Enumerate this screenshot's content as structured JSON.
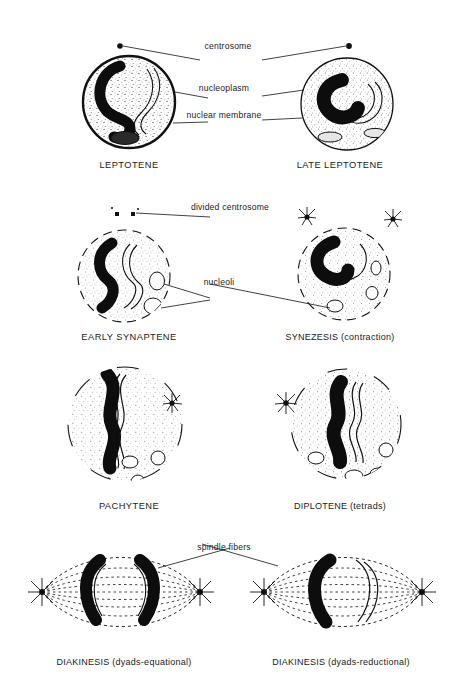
{
  "figure": {
    "background_color": "#ffffff",
    "ink_color": "#111111"
  },
  "annotations": [
    {
      "id": "centrosome",
      "label": "centrosome",
      "x": 228,
      "y": 46
    },
    {
      "id": "nucleoplasm",
      "label": "nucleoplasm",
      "x": 224,
      "y": 88
    },
    {
      "id": "nuclear-membrane",
      "label": "nuclear membrane",
      "x": 224,
      "y": 115
    },
    {
      "id": "divided-centrosome",
      "label": "divided centrosome",
      "x": 230,
      "y": 207
    },
    {
      "id": "nucleoli",
      "label": "nucleoli",
      "x": 219,
      "y": 282
    },
    {
      "id": "spindle-fibers",
      "label": "spindle fibers",
      "x": 224,
      "y": 547
    }
  ],
  "stages": [
    {
      "id": "leptotene",
      "caption": "LEPTOTENE",
      "caption_x": 129,
      "caption_y": 160,
      "row": 1,
      "col": 1
    },
    {
      "id": "late-leptotene",
      "caption": "LATE LEPTOTENE",
      "caption_x": 340,
      "caption_y": 160,
      "row": 1,
      "col": 2
    },
    {
      "id": "early-synaptene",
      "caption": "EARLY SYNAPTENE",
      "caption_x": 129,
      "caption_y": 332,
      "row": 2,
      "col": 1
    },
    {
      "id": "synezesis",
      "caption": "SYNEZESIS (contraction)",
      "caption_x": 340,
      "caption_y": 332,
      "row": 2,
      "col": 2
    },
    {
      "id": "pachytene",
      "caption": "PACHYTENE",
      "caption_x": 129,
      "caption_y": 501,
      "row": 3,
      "col": 1
    },
    {
      "id": "diplotene",
      "caption": "DIPLOTENE (tetrads)",
      "caption_x": 340,
      "caption_y": 501,
      "row": 3,
      "col": 2
    },
    {
      "id": "diakinesis-equational",
      "caption": "DIAKINESIS (dyads-equational)",
      "caption_x": 124,
      "caption_y": 657,
      "row": 4,
      "col": 1
    },
    {
      "id": "diakinesis-reductional",
      "caption": "DIAKINESIS (dyads-reductional)",
      "caption_x": 341,
      "caption_y": 657,
      "row": 4,
      "col": 2
    }
  ]
}
